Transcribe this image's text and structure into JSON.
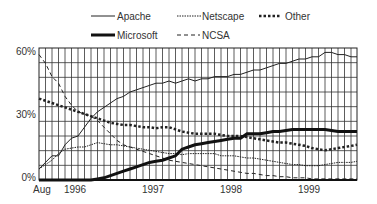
{
  "chart_data": {
    "type": "line",
    "title": "",
    "xlabel": "",
    "ylabel": "",
    "ylim": [
      0,
      60
    ],
    "grid": true,
    "legend_position": "top",
    "y_ticks": [
      "0%",
      "30%",
      "60%"
    ],
    "x_tick_labels": [
      {
        "label": "Aug",
        "month_index": 0
      },
      {
        "label": "1996",
        "month_index": 5
      },
      {
        "label": "1997",
        "month_index": 17
      },
      {
        "label": "1998",
        "month_index": 29
      },
      {
        "label": "1999",
        "month_index": 41
      }
    ],
    "x_start": "Aug 1995",
    "x_unit": "month",
    "series": [
      {
        "name": "Apache",
        "style": "thin-solid",
        "values": [
          5,
          8,
          11,
          11,
          16,
          19,
          20,
          24,
          28,
          31,
          33,
          35,
          37,
          38,
          40,
          41,
          42,
          43,
          44,
          44,
          45,
          44,
          45,
          46,
          45,
          46,
          46,
          47,
          47,
          47,
          48,
          48,
          49,
          50,
          50,
          51,
          52,
          53,
          53,
          54,
          55,
          55,
          56,
          56,
          58,
          58,
          57,
          57,
          56,
          56
        ]
      },
      {
        "name": "Microsoft",
        "style": "thick-solid",
        "values": [
          0,
          0,
          0,
          0,
          0,
          0,
          0,
          0,
          0,
          0.5,
          1,
          2,
          3,
          4,
          5,
          6,
          7,
          8,
          8.5,
          9,
          10,
          11,
          14,
          15,
          16,
          16.5,
          17,
          17.5,
          18,
          18.5,
          19,
          19,
          21,
          21,
          21,
          21.5,
          22,
          22,
          22.5,
          23,
          23,
          23,
          23,
          23,
          23,
          22.5,
          22,
          22,
          22,
          22
        ]
      },
      {
        "name": "Netscape",
        "style": "thin-dotted",
        "values": [
          5,
          7,
          9,
          12,
          14,
          14.5,
          15,
          15,
          16,
          17,
          16.5,
          16,
          16,
          15.5,
          15,
          14.5,
          14,
          13.5,
          13,
          12.5,
          12,
          12,
          11.5,
          12,
          12,
          12,
          12,
          12,
          11,
          11,
          11,
          10.5,
          10,
          10,
          9.5,
          9,
          8.5,
          8,
          7.5,
          7,
          7,
          6.5,
          6.5,
          6.5,
          7,
          7.5,
          8,
          8,
          8,
          8.5
        ]
      },
      {
        "name": "Other",
        "style": "thick-dotted",
        "values": [
          37,
          36,
          35,
          34,
          33,
          32,
          31,
          30,
          29,
          28,
          27,
          26,
          25.5,
          25,
          25,
          24.5,
          24,
          24,
          23.5,
          24,
          24,
          23,
          22,
          21.5,
          21,
          21,
          21,
          21,
          20.5,
          20,
          20,
          20,
          19.5,
          19,
          18.5,
          18,
          17.5,
          17,
          17,
          16.5,
          16,
          15.5,
          14.5,
          14,
          13.5,
          14,
          14.5,
          15,
          15.5,
          16
        ]
      },
      {
        "name": "NCSA",
        "style": "dashed",
        "values": [
          57,
          53,
          47,
          44,
          38,
          34,
          31,
          30,
          29,
          27,
          24,
          21,
          18,
          16,
          15,
          14,
          13,
          12,
          11,
          10,
          9,
          8.5,
          8,
          7.5,
          7,
          6.5,
          6,
          5.5,
          5,
          4.5,
          4,
          3.5,
          3,
          3,
          2.5,
          2,
          2,
          1.5,
          1.5,
          1,
          1,
          1,
          0.5,
          0.5,
          0.5,
          0.5,
          0.5,
          0.5,
          0.5,
          0.5
        ]
      }
    ]
  },
  "legend": {
    "apache": "Apache",
    "netscape": "Netscape",
    "other": "Other",
    "microsoft": "Microsoft",
    "ncsa": "NCSA"
  },
  "axis": {
    "y60": "60%",
    "y30": "30%",
    "y0": "0%",
    "aug": "Aug",
    "y1996": "1996",
    "y1997": "1997",
    "y1998": "1998",
    "y1999": "1999"
  },
  "colors": {
    "line": "#1a1a1a",
    "grid": "#333333"
  }
}
